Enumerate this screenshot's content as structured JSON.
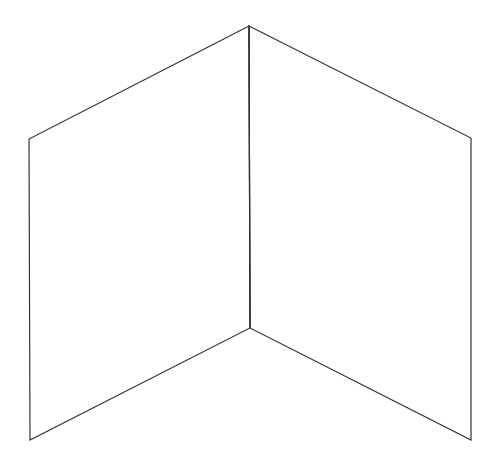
{
  "figure": {
    "stroke_color": "#333333",
    "background_color": "#ffffff",
    "panels": [
      {
        "name": "left-panel",
        "points": [
          [
            249,
            26
          ],
          [
            29,
            139
          ],
          [
            30,
            440
          ],
          [
            250,
            328
          ]
        ]
      },
      {
        "name": "right-panel",
        "points": [
          [
            249,
            26
          ],
          [
            471,
            138
          ],
          [
            471,
            440
          ],
          [
            250,
            328
          ]
        ]
      }
    ],
    "shared_edge": [
      [
        249,
        26
      ],
      [
        250,
        328
      ]
    ]
  }
}
